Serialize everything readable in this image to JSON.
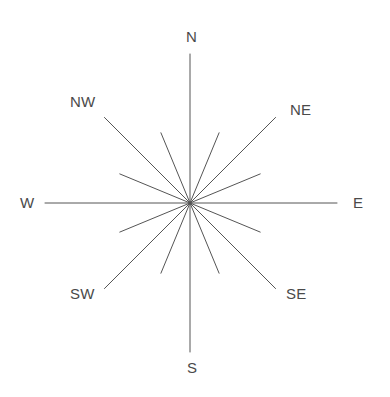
{
  "figure": {
    "name": "compass-rose",
    "width": 390,
    "height": 397,
    "background_color": "#ffffff",
    "line_color": "#555555",
    "text_color": "#4a4a4a",
    "line_width": 1,
    "center": {
      "x": 190,
      "y": 203
    }
  },
  "chart_data": {
    "type": "scatter",
    "title": "",
    "xlabel": "",
    "ylabel": "",
    "center": {
      "x": 190,
      "y": 203
    },
    "ray_count": 16,
    "labelled_ray_count": 8,
    "unlabelled_ray_count": 8,
    "angle_step_degrees": 22.5,
    "long_ray_length_px": 149,
    "short_ray_length_px": 76,
    "rays": [
      {
        "name": "N",
        "bearing_deg": 0,
        "length_px": 149,
        "labelled": true,
        "label": "N"
      },
      {
        "name": "NNE",
        "bearing_deg": 22.5,
        "length_px": 76,
        "labelled": false,
        "label": ""
      },
      {
        "name": "NE",
        "bearing_deg": 45,
        "length_px": 121,
        "labelled": true,
        "label": "NE"
      },
      {
        "name": "ENE",
        "bearing_deg": 67.5,
        "length_px": 76,
        "labelled": false,
        "label": ""
      },
      {
        "name": "E",
        "bearing_deg": 90,
        "length_px": 147,
        "labelled": true,
        "label": "E"
      },
      {
        "name": "ESE",
        "bearing_deg": 112.5,
        "length_px": 76,
        "labelled": false,
        "label": ""
      },
      {
        "name": "SE",
        "bearing_deg": 135,
        "length_px": 121,
        "labelled": true,
        "label": "SE"
      },
      {
        "name": "SSE",
        "bearing_deg": 157.5,
        "length_px": 76,
        "labelled": false,
        "label": ""
      },
      {
        "name": "S",
        "bearing_deg": 180,
        "length_px": 149,
        "labelled": true,
        "label": "S"
      },
      {
        "name": "SSW",
        "bearing_deg": 202.5,
        "length_px": 76,
        "labelled": false,
        "label": ""
      },
      {
        "name": "SW",
        "bearing_deg": 225,
        "length_px": 121,
        "labelled": true,
        "label": "SW"
      },
      {
        "name": "WSW",
        "bearing_deg": 247.5,
        "length_px": 76,
        "labelled": false,
        "label": ""
      },
      {
        "name": "W",
        "bearing_deg": 270,
        "length_px": 145,
        "labelled": true,
        "label": "W"
      },
      {
        "name": "WNW",
        "bearing_deg": 292.5,
        "length_px": 76,
        "labelled": false,
        "label": ""
      },
      {
        "name": "NW",
        "bearing_deg": 315,
        "length_px": 121,
        "labelled": true,
        "label": "NW"
      },
      {
        "name": "NNW",
        "bearing_deg": 337.5,
        "length_px": 76,
        "labelled": false,
        "label": ""
      }
    ]
  },
  "labels": {
    "north": {
      "text": "N",
      "x": 186,
      "y": 29
    },
    "northeast": {
      "text": "NE",
      "x": 290,
      "y": 102
    },
    "east": {
      "text": "E",
      "x": 353,
      "y": 195
    },
    "southeast": {
      "text": "SE",
      "x": 286,
      "y": 286
    },
    "south": {
      "text": "S",
      "x": 187,
      "y": 360
    },
    "southwest": {
      "text": "SW",
      "x": 70,
      "y": 286
    },
    "west": {
      "text": "W",
      "x": 20,
      "y": 195
    },
    "northwest": {
      "text": "NW",
      "x": 70,
      "y": 94
    }
  }
}
